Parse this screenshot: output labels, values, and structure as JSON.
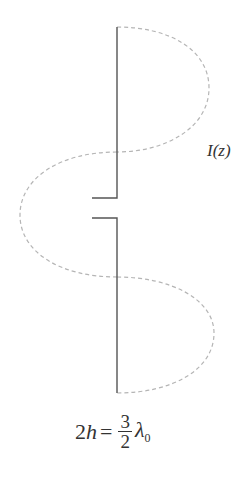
{
  "diagram": {
    "current_label": "I(z)",
    "formula": {
      "lhs_coef": "2",
      "lhs_var": "h",
      "equals": "=",
      "numerator": "3",
      "denominator": "2",
      "symbol": "λ",
      "subscript": "0"
    },
    "colors": {
      "antenna": "#555555",
      "current_curve": "#b0b0b0",
      "text": "#333333"
    },
    "antenna": {
      "upper_arm": {
        "x": 117,
        "y_top": 27,
        "y_feed": 198,
        "stub_x": 92
      },
      "lower_arm": {
        "x": 117,
        "y_feed": 218,
        "y_bottom": 393,
        "stub_x": 92
      }
    },
    "current_lobes": [
      {
        "side": "right",
        "y_start": 27,
        "y_end": 152,
        "peak_x": 209
      },
      {
        "side": "left",
        "y_start": 152,
        "y_end": 277,
        "peak_x": 20
      },
      {
        "side": "right",
        "y_start": 277,
        "y_end": 393,
        "peak_x": 214
      }
    ]
  }
}
